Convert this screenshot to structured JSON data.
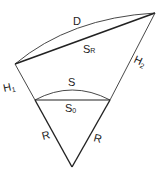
{
  "diagram": {
    "labels": {
      "D": "D",
      "SR_main": "S",
      "SR_sub": "R",
      "H1_main": "H",
      "H1_sub": "1",
      "H2_main": "H",
      "H2_sub": "2",
      "S": "S",
      "S0_main": "S",
      "S0_sub": "0",
      "R_left": "R",
      "R_right": "R"
    },
    "colors": {
      "stroke": "#222222",
      "background": "#ffffff"
    }
  }
}
